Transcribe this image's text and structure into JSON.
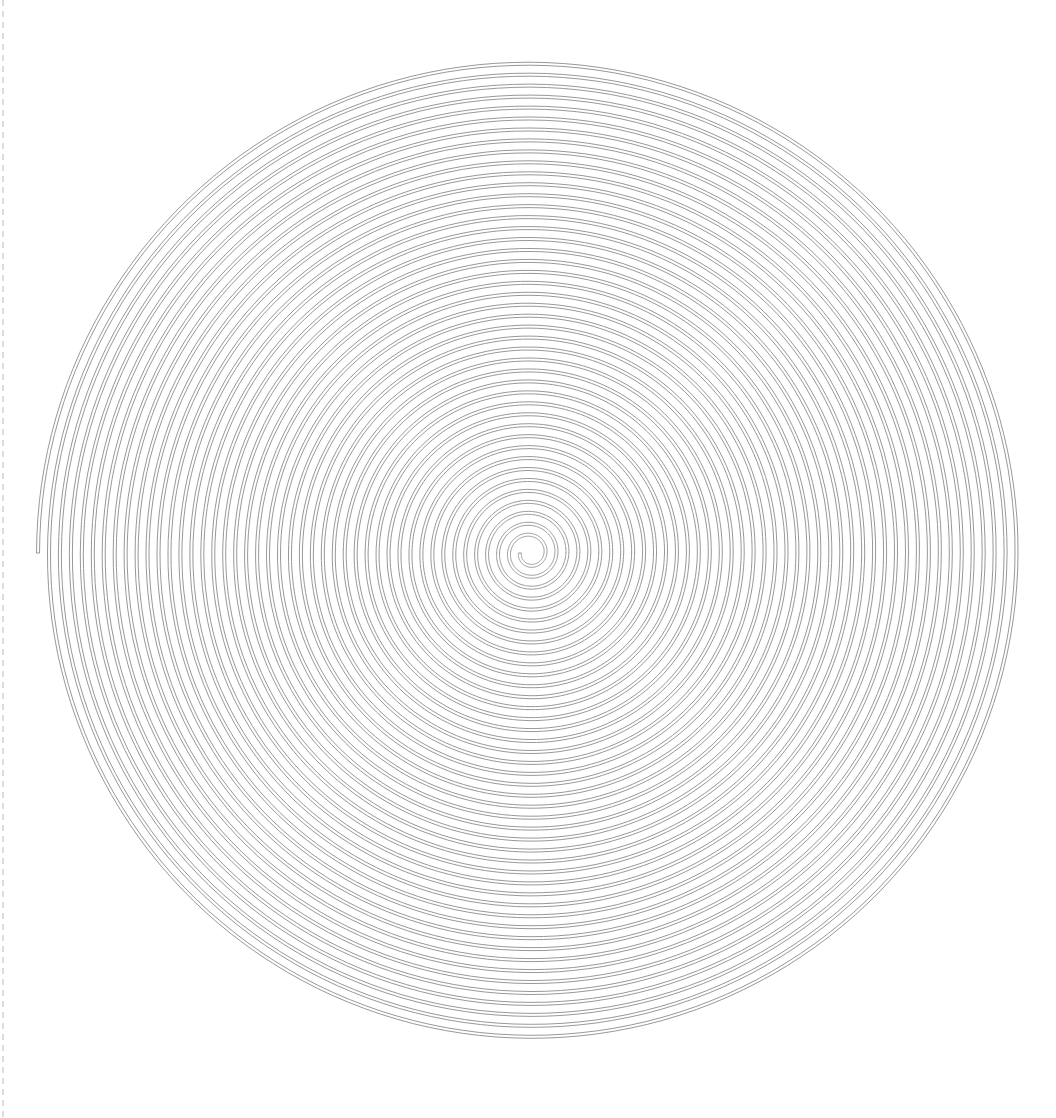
{
  "figure": {
    "type": "archimedean-spiral-band",
    "center": [
      530,
      553
    ],
    "outer_radius": 492,
    "inner_radius": 10,
    "turns": 44,
    "band_width": 3,
    "stroke_color": "#8c8c8c",
    "stroke_width": 0.9,
    "background": "#ffffff",
    "left_edge_dash_color": "#dcdcdc"
  }
}
